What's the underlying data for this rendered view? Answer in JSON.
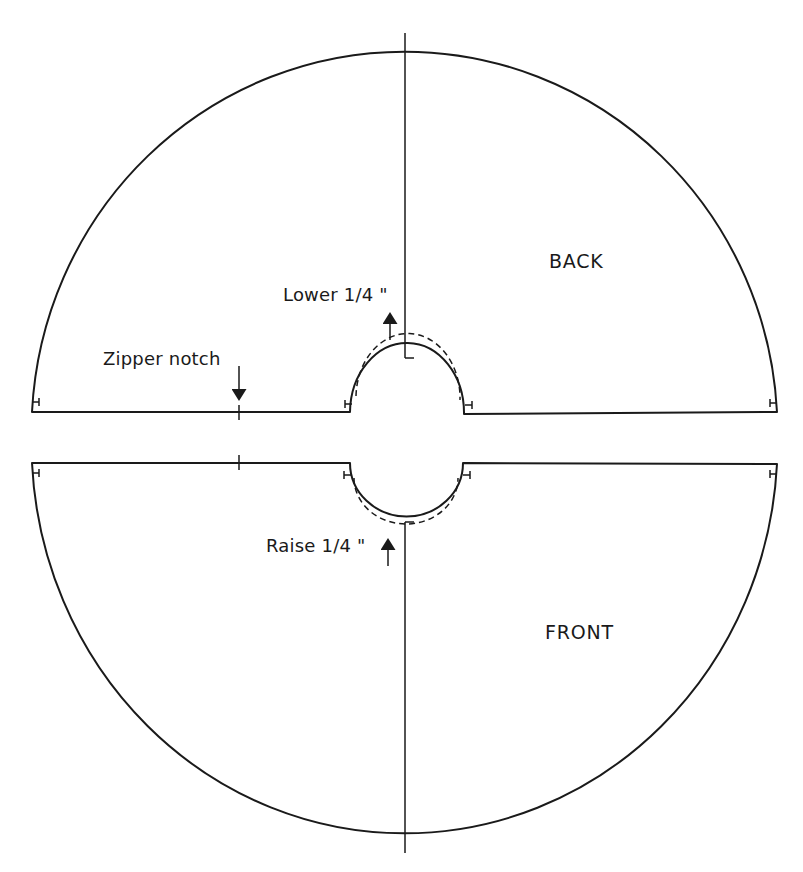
{
  "diagram": {
    "type": "sewing-pattern",
    "colors": {
      "line": "#1a1a1a",
      "background": "#ffffff"
    },
    "pieces": [
      {
        "id": "back",
        "label": "BACK"
      },
      {
        "id": "front",
        "label": "FRONT"
      }
    ],
    "annotations": {
      "zipper_notch": "Zipper notch",
      "lower": "Lower 1/4 \"",
      "raise": "Raise 1/4 \""
    },
    "markings": [
      "grainline-back",
      "grainline-front",
      "waist-adjust-dashed-back",
      "waist-adjust-dashed-front",
      "zipper-notch-back",
      "zipper-notch-front",
      "seam-allowance-ticks"
    ]
  }
}
